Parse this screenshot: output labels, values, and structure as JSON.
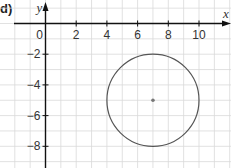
{
  "part_label": "d)",
  "chart_data": {
    "type": "scatter",
    "title": "",
    "xlabel": "x",
    "ylabel": "y",
    "xlim": [
      -2,
      12
    ],
    "ylim": [
      -9,
      1.5
    ],
    "x_ticks": [
      0,
      2,
      4,
      6,
      8,
      10
    ],
    "y_ticks": [
      -2,
      -4,
      -6,
      -8
    ],
    "x_tick_labels": [
      "0",
      "2",
      "4",
      "6",
      "8",
      "10"
    ],
    "y_tick_labels": [
      "-2",
      "-4",
      "-6",
      "-8"
    ],
    "grid": true,
    "grid_step": 1,
    "shapes": [
      {
        "type": "circle",
        "center": [
          7,
          -5
        ],
        "radius": 3,
        "stroke": "#555555"
      }
    ],
    "points": [
      {
        "x": 7,
        "y": -5,
        "label": "centre",
        "color": "#777777"
      }
    ]
  },
  "colors": {
    "grid": "#d9d9d9",
    "axis": "#111111",
    "circle": "#555555",
    "center": "#777777"
  }
}
